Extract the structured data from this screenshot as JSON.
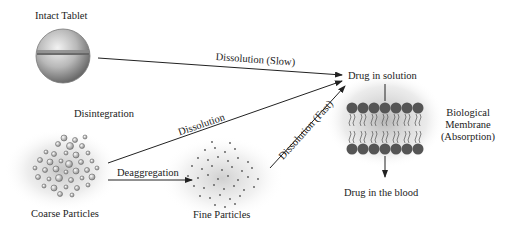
{
  "diagram": {
    "nodes": {
      "intact_tablet": "Intact Tablet",
      "coarse_particles": "Coarse Particles",
      "fine_particles": "Fine Particles",
      "drug_in_solution": "Drug in solution",
      "drug_in_blood": "Drug in the blood",
      "membrane_line1": "Biological",
      "membrane_line2": "Membrane",
      "membrane_line3": "(Absorption)"
    },
    "edges": {
      "disintegration": "Disintegration",
      "dissolution_slow": "Dissolution (Slow)",
      "dissolution": "Dissolution",
      "dissolution_fast": "Dissolution (Fast)",
      "deaggregation": "Deaggregation"
    }
  }
}
